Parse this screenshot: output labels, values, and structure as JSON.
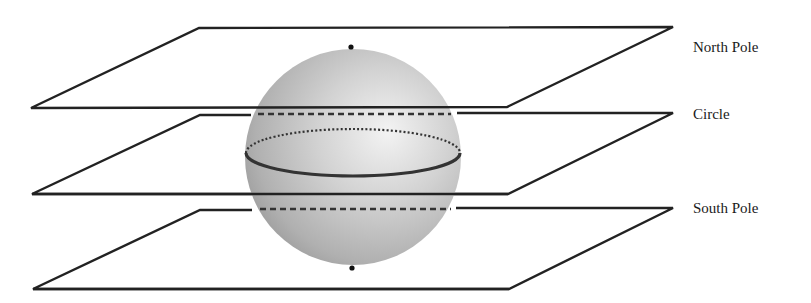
{
  "figure": {
    "type": "sphere-with-tangent-and-secant-planes",
    "labels": {
      "north_pole": "North Pole",
      "circle": "Circle",
      "south_pole": "South Pole"
    },
    "colors": {
      "line": "#222222",
      "sphere_light": "#eeeeee",
      "sphere_mid": "#c4c4c4",
      "sphere_dark": "#9a9a9a",
      "label_text": "#1a1a1a",
      "background": "#ffffff"
    },
    "sphere": {
      "center": [
        353,
        157
      ],
      "radius": 108,
      "north_pole_point": [
        351,
        47
      ],
      "south_pole_point": [
        352,
        268
      ]
    },
    "planes": [
      {
        "name": "north-pole-tangent-plane",
        "label_key": "north_pole",
        "corners": [
          [
            199,
            28
          ],
          [
            673,
            27
          ],
          [
            507,
            107
          ],
          [
            31,
            108
          ]
        ]
      },
      {
        "name": "circle-secant-plane",
        "label_key": "circle",
        "corners": [
          [
            200,
            115
          ],
          [
            673,
            113
          ],
          [
            508,
            193
          ],
          [
            32,
            194
          ]
        ]
      },
      {
        "name": "south-pole-tangent-plane",
        "label_key": "south_pole",
        "corners": [
          [
            200,
            210
          ],
          [
            673,
            208
          ],
          [
            509,
            288
          ],
          [
            33,
            289
          ]
        ]
      }
    ],
    "equator_circle": {
      "center": [
        353,
        153
      ],
      "rx": 107,
      "ry": 23,
      "front": "solid",
      "back": "dotted"
    }
  }
}
